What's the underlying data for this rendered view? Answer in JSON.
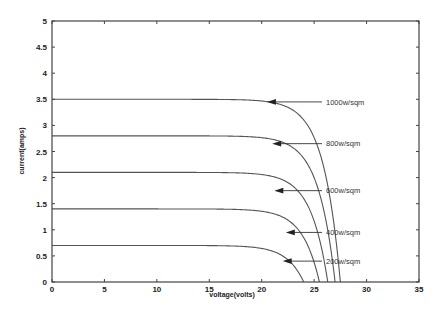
{
  "chart_data": {
    "type": "line",
    "title": "",
    "xlabel": "voltage(volts)",
    "ylabel": "current(amps)",
    "xlim": [
      0,
      35
    ],
    "ylim": [
      0,
      5
    ],
    "xticks": [
      0,
      5,
      10,
      15,
      20,
      25,
      30,
      35
    ],
    "yticks": [
      0,
      0.5,
      1,
      1.5,
      2,
      2.5,
      3,
      3.5,
      4,
      4.5,
      5
    ],
    "xtick_labels": [
      "0",
      "5",
      "10",
      "15",
      "20",
      "25",
      "30",
      "35"
    ],
    "ytick_labels": [
      "0",
      "0.5",
      "1",
      "1.5",
      "2",
      "2.5",
      "3",
      "3.5",
      "4",
      "4.5",
      "5"
    ],
    "grid": false,
    "series": [
      {
        "name": "1000w/sqm",
        "isc": 3.5,
        "voc": 27.5,
        "annotation_at": {
          "x": 20.5,
          "y": 3.45
        }
      },
      {
        "name": "800w/sqm",
        "isc": 2.8,
        "voc": 27.0,
        "annotation_at": {
          "x": 21.0,
          "y": 2.65
        }
      },
      {
        "name": "600w/sqm",
        "isc": 2.1,
        "voc": 26.3,
        "annotation_at": {
          "x": 21.2,
          "y": 1.75
        }
      },
      {
        "name": "400w/sqm",
        "isc": 1.4,
        "voc": 25.5,
        "annotation_at": {
          "x": 22.3,
          "y": 0.95
        }
      },
      {
        "name": "200w/sqm",
        "isc": 0.7,
        "voc": 24.0,
        "annotation_at": {
          "x": 22.0,
          "y": 0.4
        }
      }
    ]
  }
}
